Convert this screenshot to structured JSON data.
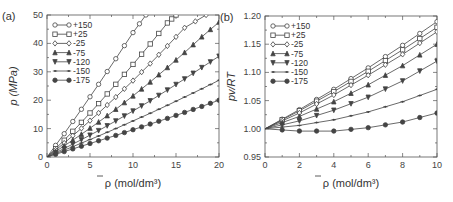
{
  "chart_data": [
    {
      "panel": "(a)",
      "type": "line",
      "title": "",
      "xlabel": "ρ̄ (mol/dm³)",
      "ylabel": "p (MPa)",
      "xlim": [
        0,
        20
      ],
      "ylim": [
        0,
        50
      ],
      "xticks": [
        "0",
        "5",
        "10",
        "15",
        "20"
      ],
      "yticks": [
        "0",
        "10",
        "20",
        "30",
        "40",
        "50"
      ],
      "grid": false,
      "legend_position": "upper-left",
      "series": [
        {
          "name": "+150",
          "marker": "circle-open",
          "x": [
            0,
            2,
            4,
            6,
            8,
            10,
            11.5
          ],
          "y": [
            0,
            8.2,
            16.8,
            25.6,
            34.6,
            43.8,
            50
          ]
        },
        {
          "name": "+25",
          "marker": "square-open",
          "x": [
            0,
            2,
            4,
            6,
            8,
            10,
            12,
            14,
            15
          ],
          "y": [
            0,
            5.9,
            12.2,
            18.8,
            25.6,
            32.6,
            39.8,
            47.2,
            50
          ]
        },
        {
          "name": "-25",
          "marker": "diamond-open",
          "x": [
            0,
            2,
            4,
            6,
            8,
            10,
            12,
            14,
            16,
            18.5
          ],
          "y": [
            0,
            4.9,
            10.1,
            15.5,
            21.1,
            26.9,
            32.9,
            39.1,
            45.5,
            50
          ]
        },
        {
          "name": "-75",
          "marker": "triangle-up",
          "x": [
            0,
            2,
            4,
            6,
            8,
            10,
            12,
            14,
            16,
            18,
            20
          ],
          "y": [
            0,
            3.9,
            8.0,
            12.3,
            16.8,
            21.5,
            26.4,
            31.5,
            36.8,
            42.3,
            47.5
          ]
        },
        {
          "name": "-120",
          "marker": "triangle-down",
          "x": [
            0,
            2,
            4,
            6,
            8,
            10,
            12,
            14,
            16,
            18,
            20
          ],
          "y": [
            0,
            3.0,
            6.1,
            9.3,
            12.7,
            16.2,
            19.8,
            23.6,
            27.5,
            31.5,
            35.5
          ]
        },
        {
          "name": "-150",
          "marker": "cross",
          "x": [
            0,
            2,
            4,
            6,
            8,
            10,
            12,
            14,
            16,
            18,
            20
          ],
          "y": [
            0,
            2.4,
            4.9,
            7.4,
            10.0,
            12.7,
            15.4,
            18.2,
            21.1,
            24.0,
            27.0
          ]
        },
        {
          "name": "-175",
          "marker": "circle-filled",
          "x": [
            0,
            2,
            4,
            6,
            8,
            10,
            12,
            14,
            16,
            18,
            20
          ],
          "y": [
            0,
            1.9,
            3.8,
            5.7,
            7.6,
            9.6,
            11.6,
            13.6,
            15.7,
            17.8,
            20.0
          ]
        }
      ]
    },
    {
      "panel": "(b)",
      "type": "line",
      "title": "",
      "xlabel": "ρ̄ (mol/dm³)",
      "ylabel": "pv/RT",
      "xlim": [
        0,
        10
      ],
      "ylim": [
        0.95,
        1.2
      ],
      "xticks": [
        "0",
        "2",
        "4",
        "6",
        "8",
        "10"
      ],
      "yticks": [
        "0.95",
        "1.00",
        "1.05",
        "1.10",
        "1.15",
        "1.20"
      ],
      "grid": false,
      "legend_position": "upper-left",
      "series": [
        {
          "name": "+150",
          "marker": "circle-open",
          "x": [
            0,
            2,
            4,
            6,
            8,
            10
          ],
          "y": [
            1.0,
            1.034,
            1.07,
            1.108,
            1.148,
            1.19
          ]
        },
        {
          "name": "+25",
          "marker": "square-open",
          "x": [
            0,
            2,
            4,
            6,
            8,
            10
          ],
          "y": [
            1.0,
            1.032,
            1.066,
            1.102,
            1.14,
            1.18
          ]
        },
        {
          "name": "-25",
          "marker": "diamond-open",
          "x": [
            0,
            2,
            4,
            6,
            8,
            10
          ],
          "y": [
            1.0,
            1.028,
            1.06,
            1.095,
            1.132,
            1.172
          ]
        },
        {
          "name": "-75",
          "marker": "triangle-up",
          "x": [
            0,
            2,
            4,
            6,
            8,
            10
          ],
          "y": [
            1.0,
            1.022,
            1.048,
            1.078,
            1.112,
            1.15
          ]
        },
        {
          "name": "-120",
          "marker": "triangle-down",
          "x": [
            0,
            2,
            4,
            6,
            8,
            10
          ],
          "y": [
            1.0,
            1.014,
            1.033,
            1.056,
            1.085,
            1.12
          ]
        },
        {
          "name": "-150",
          "marker": "cross",
          "x": [
            0,
            2,
            4,
            6,
            8,
            10
          ],
          "y": [
            1.0,
            1.006,
            1.016,
            1.03,
            1.048,
            1.07
          ]
        },
        {
          "name": "-175",
          "marker": "circle-filled",
          "x": [
            0,
            2,
            4,
            6,
            8,
            10
          ],
          "y": [
            1.0,
            0.996,
            0.996,
            1.002,
            1.012,
            1.028
          ]
        }
      ]
    }
  ]
}
